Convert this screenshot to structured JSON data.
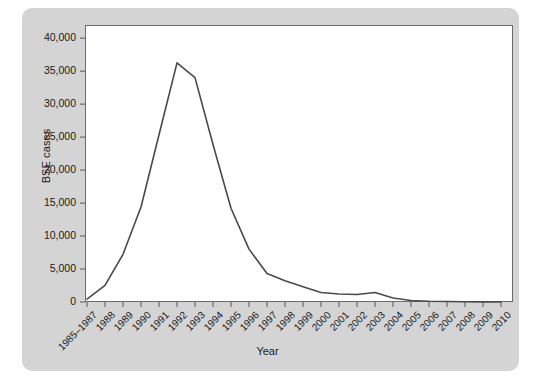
{
  "chart_data": {
    "type": "line",
    "title": "",
    "xlabel": "Year",
    "ylabel": "BSE cases",
    "categories": [
      "1985–1987",
      "1988",
      "1989",
      "1990",
      "1991",
      "1992",
      "1993",
      "1994",
      "1995",
      "1996",
      "1997",
      "1998",
      "1999",
      "2000",
      "2001",
      "2002",
      "2003",
      "2004",
      "2005",
      "2006",
      "2007",
      "2008",
      "2009",
      "2010"
    ],
    "values": [
      446,
      2514,
      7228,
      14407,
      25359,
      36254,
      34020,
      23884,
      14208,
      8016,
      4312,
      3235,
      2301,
      1443,
      1202,
      1144,
      1443,
      611,
      225,
      114,
      67,
      37,
      12,
      11
    ],
    "ylim": [
      0,
      42000
    ],
    "yticks": [
      0,
      5000,
      10000,
      15000,
      20000,
      25000,
      30000,
      35000,
      40000
    ],
    "ytick_labels": [
      "0",
      "5,000",
      "10,000",
      "15,000",
      "20,000",
      "25,000",
      "30,000",
      "35,000",
      "40,000"
    ],
    "grid": false,
    "legend": null,
    "line_color": "#4a4a4a",
    "plot_background": "#ffffff",
    "panel_background": "#d4d4d4",
    "axis_color": "#6b6b6b"
  }
}
